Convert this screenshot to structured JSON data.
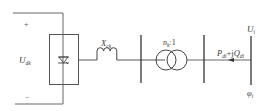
{
  "diagram": {
    "type": "circuit-schematic",
    "colors": {
      "line": "#555555",
      "text": "#3a3a3a",
      "background": "#ffffff"
    },
    "dc_side": {
      "plus_sign": "+",
      "minus_sign": "−",
      "voltage_label": {
        "main": "U",
        "sub": "dk"
      }
    },
    "converter": {
      "symbol": "thyristor-valve"
    },
    "reactor": {
      "label": {
        "main": "X",
        "sub": "ck"
      }
    },
    "transformer": {
      "ratio_main": "n",
      "ratio_sub": "k",
      "ratio_suffix": ":1"
    },
    "power_flow": {
      "p_main": "P",
      "p_sub": "di",
      "plus_j": "+j",
      "q_main": "Q",
      "q_sub": "di",
      "direction": "left"
    },
    "ac_bus": {
      "voltage_label": {
        "main": "U",
        "sub": "i"
      },
      "angle_label": {
        "main": "φ",
        "sub": "i"
      }
    }
  }
}
